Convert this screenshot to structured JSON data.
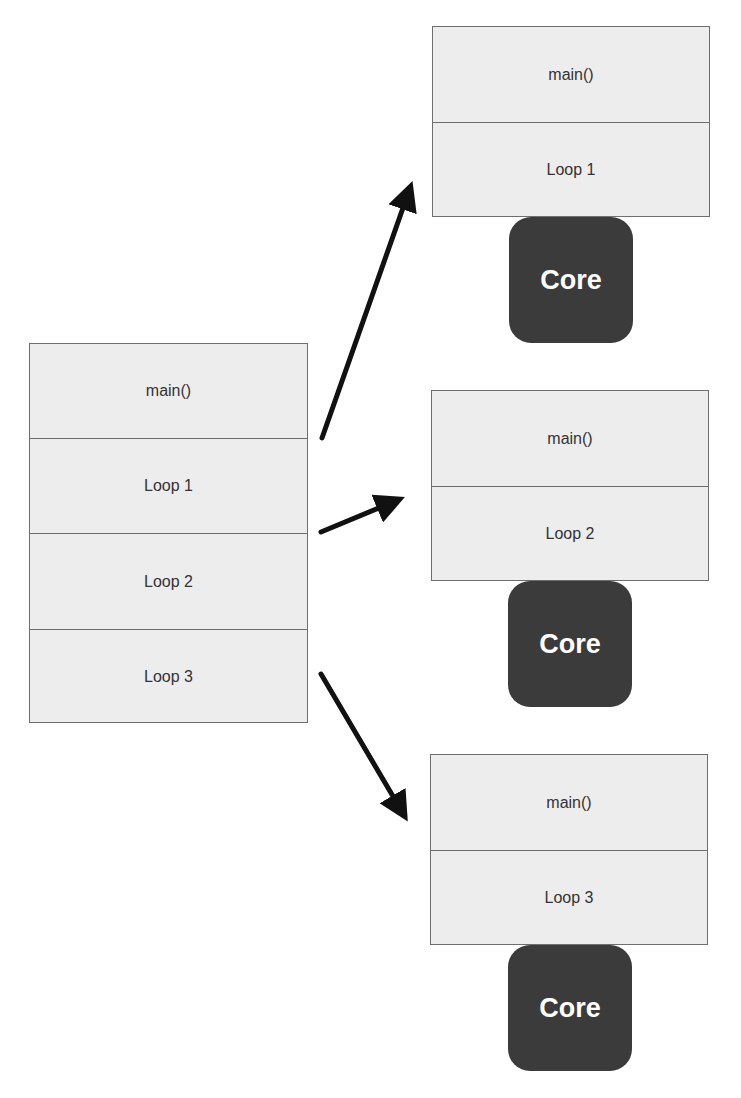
{
  "source_program": {
    "sections": [
      "main()",
      "Loop 1",
      "Loop 2",
      "Loop 3"
    ]
  },
  "parallel_units": [
    {
      "sections": [
        "main()",
        "Loop 1"
      ],
      "core_label": "Core"
    },
    {
      "sections": [
        "main()",
        "Loop 2"
      ],
      "core_label": "Core"
    },
    {
      "sections": [
        "main()",
        "Loop 3"
      ],
      "core_label": "Core"
    }
  ],
  "colors": {
    "box_fill": "#ededed",
    "box_border": "#6e6e6e",
    "core_fill": "#3b3b3b",
    "arrow": "#111111"
  }
}
